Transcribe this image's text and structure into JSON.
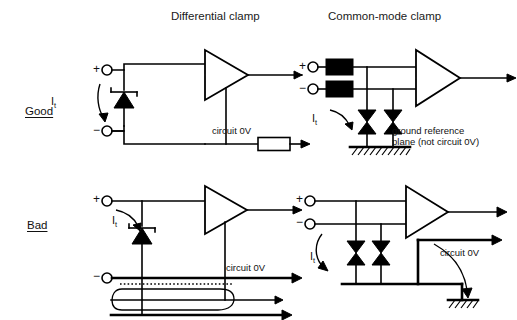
{
  "figure": {
    "column_titles": [
      "Differential clamp",
      "Common-mode clamp"
    ],
    "row_labels": [
      "Good",
      "Bad"
    ]
  },
  "panels": {
    "good_differential": {
      "name": "Good differential clamp",
      "plus_label": "+",
      "minus_label": "−",
      "current_label": "I",
      "current_subscript": "t",
      "zero_volt_label": "circuit 0V",
      "components": [
        "input-terminal-plus",
        "input-terminal-minus",
        "zener-clamp-diode",
        "amplifier",
        "series-resistor",
        "circuit-0v-rail"
      ]
    },
    "good_common_mode": {
      "name": "Good common-mode clamp",
      "plus_label": "+",
      "minus_label": "−",
      "current_label": "I",
      "current_subscript": "t",
      "ground_note": "ground reference\nplane (not circuit 0V)",
      "components": [
        "input-terminal-plus",
        "input-terminal-minus",
        "ferrite-bead-plus",
        "ferrite-bead-minus",
        "tvs-diode-1",
        "tvs-diode-2",
        "amplifier",
        "ground-reference-plane"
      ]
    },
    "bad_differential": {
      "name": "Bad differential clamp",
      "plus_label": "+",
      "minus_label": "−",
      "current_label": "I",
      "current_subscript": "t",
      "zero_volt_label": "circuit 0V",
      "components": [
        "input-terminal-plus",
        "input-terminal-minus",
        "zener-clamp-diode",
        "amplifier",
        "circuit-0v-rail",
        "current-loop",
        "dotted-return-path",
        "bottom-bus"
      ]
    },
    "bad_common_mode": {
      "name": "Bad common-mode clamp",
      "plus_label": "+",
      "minus_label": "−",
      "current_label": "I",
      "current_subscript": "t",
      "zero_volt_label": "circuit 0V",
      "components": [
        "input-terminal-plus",
        "input-terminal-minus",
        "tvs-diode-1",
        "tvs-diode-2",
        "amplifier",
        "circuit-0v-rail",
        "ground-symbol"
      ]
    }
  },
  "colors": {
    "line": "#000000",
    "background": "#ffffff",
    "text": "#111111"
  }
}
